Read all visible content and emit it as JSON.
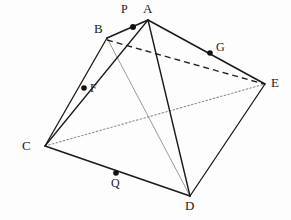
{
  "figure": {
    "width": 291,
    "height": 220,
    "background_color": "#fdfdfd",
    "stroke_color": "#1a1a1a",
    "hidden_edge_color": "#2a2a2a",
    "faint_edge_color": "#8d8d8d",
    "dot_color": "#111111"
  },
  "vertices": [
    {
      "id": "A",
      "label": "A",
      "x": 148,
      "y": 20,
      "label_x": 143,
      "label_y": 4
    },
    {
      "id": "B",
      "label": "B",
      "x": 107,
      "y": 38,
      "label_x": 94,
      "label_y": 24
    },
    {
      "id": "C",
      "label": "C",
      "x": 45,
      "y": 146,
      "label_x": 22,
      "label_y": 140
    },
    {
      "id": "D",
      "label": "D",
      "x": 190,
      "y": 196,
      "label_x": 185,
      "label_y": 199
    },
    {
      "id": "E",
      "label": "E",
      "x": 265,
      "y": 84,
      "label_x": 271,
      "label_y": 76
    }
  ],
  "points": [
    {
      "id": "P",
      "label": "P",
      "x": 133,
      "y": 27,
      "label_x": 121,
      "label_y": 5,
      "on_edge": "A-B"
    },
    {
      "id": "F",
      "label": "F",
      "x": 84,
      "y": 88,
      "label_x": 90,
      "label_y": 83,
      "on_edge": "C-A"
    },
    {
      "id": "G",
      "label": "G",
      "x": 210,
      "y": 53,
      "label_x": 216,
      "label_y": 41,
      "on_edge": "A-E"
    },
    {
      "id": "Q",
      "label": "Q",
      "x": 116,
      "y": 173,
      "label_x": 111,
      "label_y": 178,
      "on_edge": "C-D"
    }
  ],
  "edges": [
    {
      "id": "A-B",
      "from": "A",
      "to": "B",
      "style": "solid",
      "width": 1.5,
      "color": "#1a1a1a"
    },
    {
      "id": "A-E",
      "from": "A",
      "to": "E",
      "style": "solid",
      "width": 1.5,
      "color": "#1a1a1a"
    },
    {
      "id": "E-D",
      "from": "E",
      "to": "D",
      "style": "solid",
      "width": 1.3,
      "color": "#1a1a1a"
    },
    {
      "id": "D-C",
      "from": "D",
      "to": "C",
      "style": "solid",
      "width": 1.5,
      "color": "#1a1a1a"
    },
    {
      "id": "C-B",
      "from": "C",
      "to": "B",
      "style": "solid",
      "width": 1.3,
      "color": "#1a1a1a"
    },
    {
      "id": "C-A",
      "from": "C",
      "to": "A",
      "style": "solid",
      "width": 1.3,
      "color": "#1a1a1a"
    },
    {
      "id": "A-D",
      "from": "A",
      "to": "D",
      "style": "solid",
      "width": 1.4,
      "color": "#1a1a1a"
    },
    {
      "id": "B-E",
      "from": "B",
      "to": "E",
      "style": "dashed",
      "width": 1.4,
      "color": "#222222",
      "dash": "6,4"
    },
    {
      "id": "C-E",
      "from": "C",
      "to": "E",
      "style": "dotted",
      "width": 1.1,
      "color": "#8d8d8d",
      "dash": "1.6,2.2"
    },
    {
      "id": "B-D",
      "from": "B",
      "to": "D",
      "style": "solid",
      "width": 1.0,
      "color": "#9a9a9a"
    }
  ],
  "labels": {
    "A": "A",
    "B": "B",
    "C": "C",
    "D": "D",
    "E": "E",
    "P": "P",
    "F": "F",
    "G": "G",
    "Q": "Q"
  }
}
